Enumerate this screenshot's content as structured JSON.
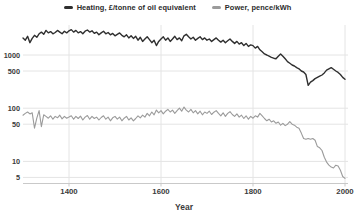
{
  "chart_data": {
    "type": "line",
    "xlabel": "Year",
    "y_scale": "log",
    "xlim": [
      1300,
      2000
    ],
    "ylim": [
      4,
      3700
    ],
    "yticks": [
      1000,
      500,
      100,
      50,
      10,
      5
    ],
    "xticks": [
      1400,
      1600,
      1800,
      2000
    ],
    "grid": true,
    "legend_position": "top",
    "x": [
      1300,
      1305,
      1310,
      1315,
      1320,
      1325,
      1330,
      1335,
      1340,
      1345,
      1350,
      1355,
      1360,
      1365,
      1370,
      1375,
      1380,
      1385,
      1390,
      1395,
      1400,
      1405,
      1410,
      1415,
      1420,
      1425,
      1430,
      1435,
      1440,
      1445,
      1450,
      1455,
      1460,
      1465,
      1470,
      1475,
      1480,
      1485,
      1490,
      1495,
      1500,
      1505,
      1510,
      1515,
      1520,
      1525,
      1530,
      1535,
      1540,
      1545,
      1550,
      1555,
      1560,
      1565,
      1570,
      1575,
      1580,
      1585,
      1590,
      1595,
      1600,
      1605,
      1610,
      1615,
      1620,
      1625,
      1630,
      1635,
      1640,
      1645,
      1650,
      1655,
      1660,
      1665,
      1670,
      1675,
      1680,
      1685,
      1690,
      1695,
      1700,
      1705,
      1710,
      1715,
      1720,
      1725,
      1730,
      1735,
      1740,
      1745,
      1750,
      1755,
      1760,
      1765,
      1770,
      1775,
      1780,
      1785,
      1790,
      1795,
      1800,
      1805,
      1810,
      1815,
      1820,
      1825,
      1830,
      1835,
      1840,
      1845,
      1850,
      1855,
      1860,
      1865,
      1870,
      1875,
      1880,
      1885,
      1890,
      1895,
      1900,
      1905,
      1910,
      1915,
      1920,
      1925,
      1930,
      1935,
      1940,
      1945,
      1950,
      1955,
      1960,
      1965,
      1970,
      1975,
      1980,
      1985,
      1990,
      1995,
      2000
    ],
    "series": [
      {
        "name": "Heating, £/tonne of oil equivalent",
        "color": "#2f2f2f",
        "width": 1.4,
        "values": [
          2100,
          1900,
          2250,
          1700,
          2050,
          2350,
          2150,
          2500,
          2700,
          2450,
          2900,
          2600,
          2750,
          2500,
          2650,
          2900,
          2700,
          2500,
          2800,
          2600,
          2850,
          3000,
          2700,
          2900,
          2600,
          2750,
          2500,
          2800,
          2950,
          2700,
          2850,
          2550,
          2700,
          2400,
          2600,
          2800,
          2500,
          2650,
          2400,
          2550,
          2300,
          2450,
          2600,
          2350,
          2200,
          2400,
          2100,
          2300,
          2050,
          2250,
          1900,
          2150,
          1800,
          2000,
          2200,
          1950,
          1700,
          1900,
          1500,
          1800,
          2000,
          2200,
          1900,
          2100,
          1800,
          2000,
          2250,
          1950,
          2100,
          1850,
          2300,
          2450,
          2200,
          2000,
          2150,
          1900,
          2050,
          2200,
          1950,
          2100,
          1900,
          2000,
          1800,
          1950,
          2100,
          1900,
          1750,
          1900,
          1700,
          1850,
          2000,
          1800,
          1650,
          1800,
          1600,
          1700,
          1500,
          1650,
          1450,
          1550,
          1500,
          1350,
          1450,
          1250,
          1150,
          1050,
          1000,
          950,
          900,
          870,
          850,
          950,
          1050,
          950,
          850,
          750,
          700,
          650,
          620,
          580,
          550,
          500,
          480,
          430,
          270,
          310,
          330,
          360,
          380,
          400,
          420,
          460,
          520,
          550,
          580,
          540,
          500,
          470,
          430,
          380,
          350
        ]
      },
      {
        "name": "Power, pence/kWh",
        "color": "#9b9b9b",
        "width": 1.1,
        "values": [
          74,
          80,
          85,
          78,
          82,
          42,
          65,
          90,
          45,
          75,
          70,
          65,
          72,
          62,
          70,
          66,
          74,
          63,
          70,
          65,
          68,
          72,
          62,
          70,
          64,
          71,
          60,
          68,
          73,
          62,
          70,
          64,
          68,
          60,
          67,
          72,
          62,
          68,
          58,
          66,
          70,
          62,
          68,
          58,
          65,
          70,
          60,
          66,
          58,
          64,
          72,
          66,
          74,
          68,
          80,
          72,
          85,
          75,
          92,
          82,
          90,
          78,
          88,
          95,
          85,
          92,
          80,
          90,
          100,
          88,
          105,
          92,
          85,
          95,
          82,
          90,
          78,
          88,
          75,
          85,
          80,
          88,
          76,
          84,
          90,
          80,
          72,
          82,
          70,
          80,
          86,
          76,
          70,
          78,
          68,
          74,
          64,
          72,
          62,
          70,
          65,
          72,
          68,
          80,
          72,
          64,
          58,
          62,
          55,
          58,
          52,
          55,
          48,
          52,
          47,
          50,
          56,
          50,
          48,
          44,
          42,
          34,
          27,
          26,
          27,
          26,
          27,
          25,
          19,
          18,
          16,
          12,
          9.7,
          8.5,
          7.8,
          7.5,
          8.5,
          8.2,
          6.8,
          5.2,
          4.8
        ]
      }
    ]
  },
  "style": {
    "grid_color": "#e4e4e4",
    "axis_color": "#c9c9c9",
    "tick_text_color": "#3b3b3b"
  }
}
